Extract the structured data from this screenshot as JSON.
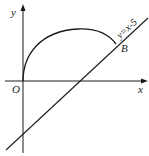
{
  "diagram": {
    "axes": {
      "x_label": "x",
      "y_label": "y",
      "origin_label": "O"
    },
    "line": {
      "equation_label": "y = x - 5",
      "label_text": "y=x-5"
    },
    "arc": {
      "description": "curve from origin O to point B"
    },
    "points": {
      "B_label": "B"
    },
    "colors": {
      "stroke": "#1a1a1a",
      "background": "#ffffff"
    }
  }
}
